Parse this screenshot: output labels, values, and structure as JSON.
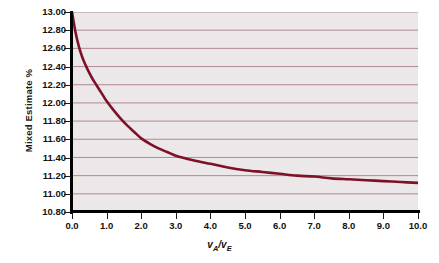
{
  "chart_data": {
    "type": "line",
    "title": "",
    "subtitle": "",
    "xlabel": "vA/vE",
    "xlabel_parts": {
      "var1": "v",
      "sub1": "A",
      "separator": "/",
      "var2": "v",
      "sub2": "E"
    },
    "ylabel": "Mixed Estimate %",
    "xlim": [
      0.0,
      10.0
    ],
    "ylim": [
      10.8,
      13.0
    ],
    "xticks": [
      "0.0",
      "1.0",
      "2.0",
      "3.0",
      "4.0",
      "5.0",
      "6.0",
      "7.0",
      "8.0",
      "9.0",
      "10.0"
    ],
    "xtick_values": [
      0,
      1,
      2,
      3,
      4,
      5,
      6,
      7,
      8,
      9,
      10
    ],
    "yticks": [
      "13.00",
      "12.80",
      "12.60",
      "12.40",
      "12.20",
      "12.00",
      "11.80",
      "11.60",
      "11.40",
      "11.20",
      "11.00",
      "10.80"
    ],
    "ytick_values": [
      13.0,
      12.8,
      12.6,
      12.4,
      12.2,
      12.0,
      11.8,
      11.6,
      11.4,
      11.2,
      11.0,
      10.8
    ],
    "grid": "horizontal",
    "grid_color": "#b08a92",
    "plot_background": "#ece7e8",
    "line_color": "#7d1128",
    "line_width": 2.6,
    "axis_color": "#000000",
    "legend": null,
    "series": [
      {
        "name": "Mixed Estimate",
        "x": [
          0.0,
          0.1,
          0.2,
          0.3,
          0.4,
          0.5,
          0.6,
          0.7,
          0.8,
          0.9,
          1.0,
          1.2,
          1.4,
          1.6,
          1.8,
          2.0,
          2.25,
          2.5,
          2.75,
          3.0,
          3.5,
          4.0,
          4.5,
          5.0,
          5.5,
          6.0,
          6.5,
          7.0,
          7.5,
          8.0,
          8.5,
          9.0,
          9.5,
          10.0
        ],
        "values": [
          13.0,
          12.78,
          12.62,
          12.5,
          12.41,
          12.33,
          12.26,
          12.2,
          12.14,
          12.08,
          12.02,
          11.92,
          11.83,
          11.75,
          11.68,
          11.61,
          11.55,
          11.5,
          11.46,
          11.42,
          11.37,
          11.33,
          11.29,
          11.26,
          11.24,
          11.22,
          11.2,
          11.19,
          11.17,
          11.16,
          11.15,
          11.14,
          11.13,
          11.12
        ]
      }
    ],
    "annotations": []
  }
}
